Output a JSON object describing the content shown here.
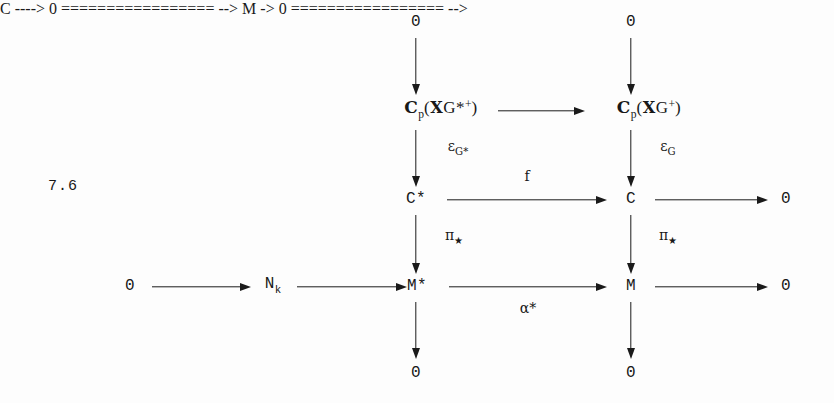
{
  "figure": {
    "equation_number": "7.6",
    "ink_color": "#1a1a1a",
    "background_color": "#fdfdfd"
  },
  "nodes": {
    "zero_top_left": "0",
    "zero_top_right": "0",
    "cp_star": {
      "head": "C",
      "head_sub": "p",
      "open": "(",
      "frak": "X",
      "g": "G",
      "star": "*",
      "plus": "+",
      "close": ")"
    },
    "cp_plain": {
      "head": "C",
      "head_sub": "p",
      "open": "(",
      "frak": "X",
      "g": "G",
      "plus": "+",
      "close": ")"
    },
    "c_star": "C*",
    "c_plain": "C",
    "zero_mid_right": "0",
    "zero_bottom_left_row": "0",
    "n_k": {
      "base": "N",
      "sub": "k"
    },
    "m_star": "M*",
    "m_plain": "M",
    "zero_bottom_right_row": "0",
    "zero_bottom_left": "0",
    "zero_bottom_right": "0"
  },
  "arrow_labels": {
    "epsilon_g_star": {
      "base": "ε",
      "sub": "G*"
    },
    "epsilon_g": {
      "base": "ε",
      "sub": "G"
    },
    "f": "f",
    "pi_star_left": {
      "base": "π",
      "sub": "★"
    },
    "pi_star_right": {
      "base": "π",
      "sub": "★"
    },
    "alpha_star": "α*"
  }
}
